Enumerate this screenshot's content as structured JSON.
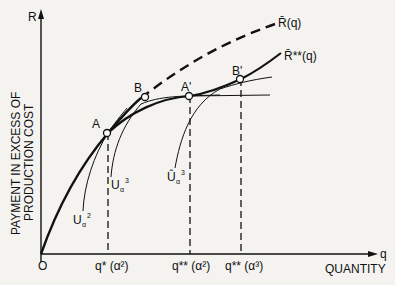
{
  "diagram": {
    "y_axis": {
      "symbol": "R",
      "label_line1": "PAYMENT IN EXCESS OF",
      "label_line2": "PRODUCTION COST"
    },
    "x_axis": {
      "symbol": "q",
      "label": "QUANTITY",
      "origin": "O"
    },
    "curves": {
      "r_bar": "R̄(q)",
      "r_bar_star": "R̄**(q)",
      "u_alpha2": {
        "base": "U",
        "sub": "α",
        "sup": "2"
      },
      "u_alpha3": {
        "base": "U",
        "sub": "α",
        "sup": "3"
      },
      "u_hat_alpha3": {
        "base": "Û",
        "sub": "α",
        "sup": "3"
      }
    },
    "points": {
      "A": "A",
      "B": "B",
      "A_prime": "A'",
      "B_prime": "B'"
    },
    "x_ticks": [
      {
        "label": "q* (α²)"
      },
      {
        "label": "q** (α²)"
      },
      {
        "label": "q** (α³)"
      }
    ]
  }
}
